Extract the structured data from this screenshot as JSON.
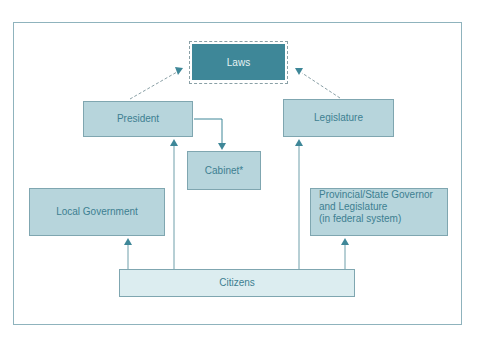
{
  "diagram": {
    "nodes": {
      "laws": "Laws",
      "president": "President",
      "legislature": "Legislature",
      "cabinet": "Cabinet*",
      "local_government": "Local Government",
      "provincial": [
        "Provincial/State Governor",
        "and Legislature",
        "(in federal system)"
      ],
      "citizens": "Citizens"
    },
    "edges": [
      {
        "from": "president",
        "to": "laws",
        "style": "dashed"
      },
      {
        "from": "legislature",
        "to": "laws",
        "style": "dashed"
      },
      {
        "from": "president",
        "to": "cabinet",
        "style": "solid"
      },
      {
        "from": "citizens",
        "to": "president",
        "style": "solid"
      },
      {
        "from": "citizens",
        "to": "legislature",
        "style": "solid"
      },
      {
        "from": "citizens",
        "to": "local_government",
        "style": "solid"
      },
      {
        "from": "citizens",
        "to": "provincial",
        "style": "solid"
      }
    ],
    "colors": {
      "laws_fill": "#3e8798",
      "node_fill": "#b7d5dc",
      "citizens_fill": "#dcedf0",
      "text": "#3d7f91",
      "arrow": "#3e8798"
    }
  }
}
